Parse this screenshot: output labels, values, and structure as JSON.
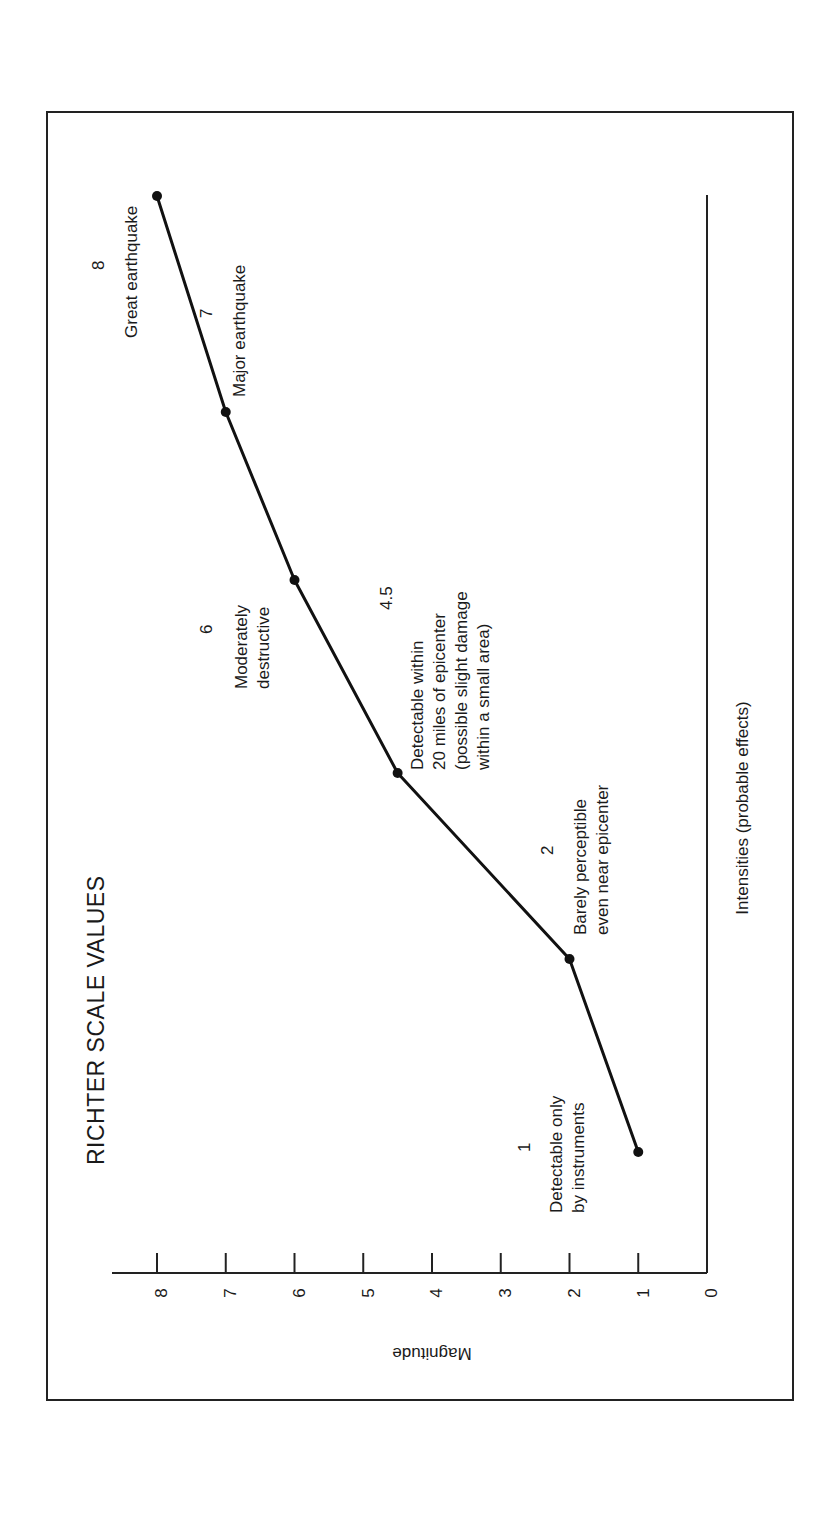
{
  "chart_data": {
    "type": "line",
    "title": "RICHTER SCALE VALUES",
    "xlabel": "Intensities (probable effects)",
    "ylabel": "Magnitude",
    "orientation_note": "figure printed rotated 90 degrees clockwise",
    "ylim": [
      0,
      8
    ],
    "yticks": [
      "0",
      "1",
      "2",
      "3",
      "4",
      "5",
      "6",
      "7",
      "8"
    ],
    "grid": false,
    "legend": null,
    "points": [
      {
        "magnitude": 1,
        "value_label": "1",
        "effect": "Detectable only by instruments",
        "lines": [
          "Detectable only",
          "by instruments"
        ]
      },
      {
        "magnitude": 2,
        "value_label": "2",
        "effect": "Barely perceptible even near epicenter",
        "lines": [
          "Barely perceptible",
          "even near epicenter"
        ]
      },
      {
        "magnitude": 4.5,
        "value_label": "4.5",
        "effect": "Detectable within 20 miles of epicenter (possible slight damage within a small area)",
        "lines": [
          "Detectable within",
          "20 miles of epicenter",
          "(possible slight damage",
          "within a small area)"
        ]
      },
      {
        "magnitude": 6,
        "value_label": "6",
        "effect": "Moderately destructive",
        "lines": [
          "Moderately",
          "destructive"
        ]
      },
      {
        "magnitude": 7,
        "value_label": "7",
        "effect": "Major earthquake",
        "lines": [
          "Major earthquake"
        ]
      },
      {
        "magnitude": 8,
        "value_label": "8",
        "effect": "Great earthquake",
        "lines": [
          "Great earthquake"
        ]
      }
    ],
    "categories": [
      "Detectable only by instruments",
      "Barely perceptible even near epicenter",
      "Detectable within 20 miles of epicenter (possible slight damage within a small area)",
      "Moderately destructive",
      "Major earthquake",
      "Great earthquake"
    ],
    "values": [
      1,
      2,
      4.5,
      6,
      7,
      8
    ]
  },
  "colors": {
    "line": "#111111",
    "background": "#ffffff",
    "frame": "#222222"
  }
}
